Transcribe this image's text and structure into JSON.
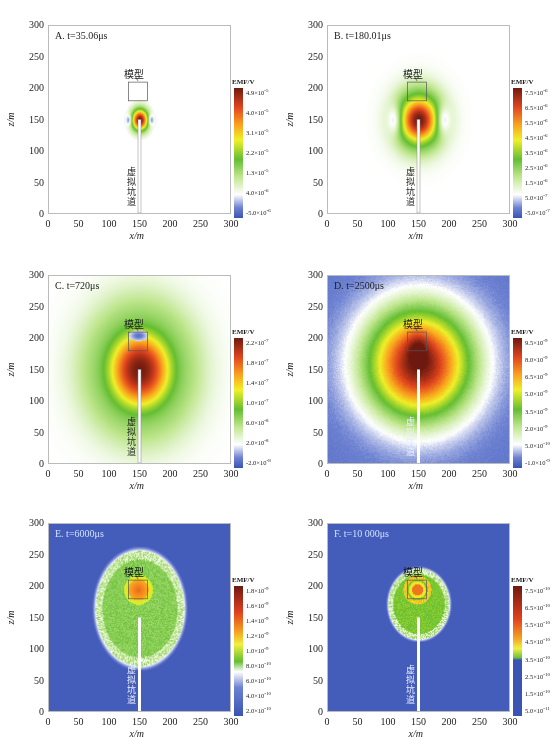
{
  "figure": {
    "axis_labels": {
      "x": "x/m",
      "z": "z/m"
    },
    "model_label": "模型",
    "tunnel_label": "虚拟坑道",
    "colorbar_title": "EMF/V"
  },
  "chart_data": [
    {
      "type": "heatmap",
      "panel": "A",
      "title": "A. t=35.06μs",
      "xlabel": "x/m",
      "ylabel": "z/m",
      "xlim": [
        0,
        300
      ],
      "ylim": [
        0,
        300
      ],
      "xticks": [
        "0",
        "50",
        "100",
        "150",
        "200",
        "250",
        "300"
      ],
      "yticks": [
        "0",
        "50",
        "100",
        "150",
        "200",
        "250",
        "300"
      ],
      "source": {
        "x": 150,
        "z": 150
      },
      "tunnel": {
        "x": 150,
        "z_from": 0,
        "z_to": 150
      },
      "model_box": {
        "x0": 132,
        "x1": 163,
        "z0": 180,
        "z1": 210
      },
      "field": {
        "core_radius": 12,
        "side_lobes": true,
        "halo_radius": 0,
        "background": "white"
      },
      "colorbar": {
        "title": "EMF/V",
        "labels": [
          "4.9×10^-5",
          "4.0×10^-5",
          "3.1×10^-5",
          "2.2×10^-5",
          "1.3×10^-5",
          "4.0×10^-6",
          "-5.0×10^-6"
        ]
      }
    },
    {
      "type": "heatmap",
      "panel": "B",
      "title": "B. t=180.01μs",
      "xlabel": "x/m",
      "ylabel": "z/m",
      "xlim": [
        0,
        300
      ],
      "ylim": [
        0,
        300
      ],
      "xticks": [
        "0",
        "50",
        "100",
        "150",
        "200",
        "250",
        "300"
      ],
      "yticks": [
        "0",
        "50",
        "100",
        "150",
        "200",
        "250",
        "300"
      ],
      "source": {
        "x": 150,
        "z": 150
      },
      "tunnel": {
        "x": 150,
        "z_from": 0,
        "z_to": 150
      },
      "model_box": {
        "x0": 132,
        "x1": 163,
        "z0": 180,
        "z1": 210
      },
      "field": {
        "core_radius": 30,
        "side_lobes": true,
        "halo_radius": 60,
        "background": "white"
      },
      "colorbar": {
        "title": "EMF/V",
        "labels": [
          "7.5×10^-6",
          "6.5×10^-6",
          "5.5×10^-6",
          "4.5×10^-6",
          "3.5×10^-6",
          "2.5×10^-6",
          "1.5×10^-6",
          "5.0×10^-7",
          "-5.0×10^-7"
        ]
      }
    },
    {
      "type": "heatmap",
      "panel": "C",
      "title": "C. t=720μs",
      "xlabel": "x/m",
      "ylabel": "z/m",
      "xlim": [
        0,
        300
      ],
      "ylim": [
        0,
        300
      ],
      "xticks": [
        "0",
        "50",
        "100",
        "150",
        "200",
        "250",
        "300"
      ],
      "yticks": [
        "0",
        "50",
        "100",
        "150",
        "200",
        "250",
        "300"
      ],
      "source": {
        "x": 150,
        "z": 150
      },
      "tunnel": {
        "x": 150,
        "z_from": 0,
        "z_to": 150
      },
      "model_box": {
        "x0": 132,
        "x1": 163,
        "z0": 180,
        "z1": 210
      },
      "field": {
        "core_radius": 60,
        "side_lobes": false,
        "halo_radius": 120,
        "background": "white"
      },
      "colorbar": {
        "title": "EMF/V",
        "labels": [
          "2.2×10^-7",
          "1.8×10^-7",
          "1.4×10^-7",
          "1.0×10^-7",
          "6.0×10^-8",
          "2.0×10^-8",
          "-2.0×10^-8"
        ]
      }
    },
    {
      "type": "heatmap",
      "panel": "D",
      "title": "D. t=2500μs",
      "xlabel": "x/m",
      "ylabel": "z/m",
      "xlim": [
        0,
        300
      ],
      "ylim": [
        0,
        300
      ],
      "xticks": [
        "0",
        "50",
        "100",
        "150",
        "200",
        "250",
        "300"
      ],
      "yticks": [
        "0",
        "50",
        "100",
        "150",
        "200",
        "250",
        "300"
      ],
      "source": {
        "x": 150,
        "z": 150
      },
      "tunnel": {
        "x": 150,
        "z_from": 0,
        "z_to": 150
      },
      "model_box": {
        "x0": 132,
        "x1": 163,
        "z0": 180,
        "z1": 210
      },
      "field": {
        "core_radius": 105,
        "side_lobes": false,
        "halo_radius": 150,
        "background": "blue"
      },
      "colorbar": {
        "title": "EMF/V",
        "labels": [
          "9.5×10^-9",
          "8.0×10^-9",
          "6.5×10^-9",
          "5.0×10^-9",
          "3.5×10^-9",
          "2.0×10^-9",
          "5.0×10^-10",
          "-1.0×10^-9"
        ]
      }
    },
    {
      "type": "heatmap",
      "panel": "E",
      "title": "E. t=6000μs",
      "xlabel": "x/m",
      "ylabel": "z/m",
      "xlim": [
        0,
        300
      ],
      "ylim": [
        0,
        300
      ],
      "xticks": [
        "0",
        "50",
        "100",
        "150",
        "200",
        "250",
        "300"
      ],
      "yticks": [
        "0",
        "50",
        "100",
        "150",
        "200",
        "250",
        "300"
      ],
      "source": {
        "x": 150,
        "z": 150
      },
      "tunnel": {
        "x": 150,
        "z_from": 0,
        "z_to": 150
      },
      "model_box": {
        "x0": 132,
        "x1": 163,
        "z0": 180,
        "z1": 210
      },
      "field": {
        "core_radius": 80,
        "side_lobes": false,
        "halo_radius": 0,
        "background": "blue",
        "hotspot": "model"
      },
      "colorbar": {
        "title": "EMF/V",
        "labels": [
          "1.8×10^-9",
          "1.6×10^-9",
          "1.4×10^-9",
          "1.2×10^-9",
          "1.0×10^-9",
          "8.0×10^-10",
          "6.0×10^-10",
          "4.0×10^-10",
          "2.0×10^-10"
        ]
      }
    },
    {
      "type": "heatmap",
      "panel": "F",
      "title": "F. t=10 000μs",
      "xlabel": "x/m",
      "ylabel": "z/m",
      "xlim": [
        0,
        300
      ],
      "ylim": [
        0,
        300
      ],
      "xticks": [
        "0",
        "50",
        "100",
        "150",
        "200",
        "250",
        "300"
      ],
      "yticks": [
        "0",
        "50",
        "100",
        "150",
        "200",
        "250",
        "300"
      ],
      "source": {
        "x": 150,
        "z": 150
      },
      "tunnel": {
        "x": 150,
        "z_from": 0,
        "z_to": 150
      },
      "model_box": {
        "x0": 132,
        "x1": 163,
        "z0": 180,
        "z1": 210
      },
      "field": {
        "core_radius": 55,
        "side_lobes": false,
        "halo_radius": 0,
        "background": "blue",
        "hotspot": "model"
      },
      "colorbar": {
        "title": "EMF/V",
        "labels": [
          "7.5×10^-10",
          "6.5×10^-10",
          "5.5×10^-10",
          "4.5×10^-10",
          "3.5×10^-10",
          "2.5×10^-10",
          "1.5×10^-10",
          "5.0×10^-11"
        ]
      }
    }
  ]
}
